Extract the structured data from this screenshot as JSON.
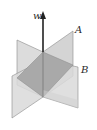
{
  "figure": {
    "vector_label": "w",
    "plane_a_label": "A",
    "plane_b_label": "B",
    "colors": {
      "plane_light": "#d9d9d9",
      "plane_dark": "#a6a6a6",
      "edge": "#8a8a8a",
      "vector": "#222222",
      "background": "#ffffff"
    }
  }
}
